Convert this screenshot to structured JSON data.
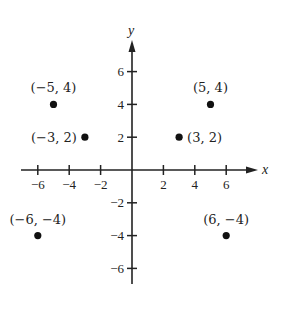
{
  "chart_data": {
    "type": "scatter",
    "title": "",
    "xlabel": "x",
    "ylabel": "y",
    "xlim": [
      -7,
      8
    ],
    "ylim": [
      -7,
      8
    ],
    "grid": false,
    "legend": null,
    "x_ticks": [
      -6,
      -4,
      -2,
      2,
      4,
      6
    ],
    "y_ticks": [
      6,
      4,
      2,
      -2,
      -4,
      -6
    ],
    "x_tick_labels": [
      "−6",
      "−4",
      "−2",
      "2",
      "4",
      "6"
    ],
    "y_tick_labels": [
      "6",
      "4",
      "2",
      "−2",
      "−4",
      "−6"
    ],
    "points": [
      {
        "x": -5,
        "y": 4,
        "label": "(−5, 4)"
      },
      {
        "x": 5,
        "y": 4,
        "label": "(5, 4)"
      },
      {
        "x": -3,
        "y": 2,
        "label": "(−3, 2)"
      },
      {
        "x": 3,
        "y": 2,
        "label": "(3, 2)"
      },
      {
        "x": -6,
        "y": -4,
        "label": "(−6, −4)"
      },
      {
        "x": 6,
        "y": -4,
        "label": "(6, −4)"
      }
    ]
  },
  "colors": {
    "ink": "#222222",
    "background": "#ffffff"
  }
}
